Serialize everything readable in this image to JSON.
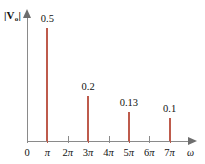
{
  "chart_data": {
    "type": "bar",
    "title": "",
    "subtitle": "",
    "xlabel": "ω",
    "ylabel": "|V₀|",
    "ylabel_main": "|V",
    "ylabel_sub": "o",
    "ylabel_close": "|",
    "categories": [
      "0",
      "π",
      "2π",
      "3π",
      "4π",
      "5π",
      "6π",
      "7π"
    ],
    "x": [
      0,
      1,
      2,
      3,
      4,
      5,
      6,
      7
    ],
    "values": [
      0,
      0.5,
      0,
      0.2,
      0,
      0.13,
      0,
      0.1
    ],
    "data_labels": [
      "",
      "0.5",
      "",
      "0.2",
      "",
      "0.13",
      "",
      "0.1"
    ],
    "xlim": [
      0,
      7.9
    ],
    "ylim": [
      0,
      0.58
    ],
    "grid": false,
    "legend": null,
    "annotations": [],
    "bar_color": "#be5b4c",
    "axis_color": "#8a8a8a",
    "text_color": "#111111"
  },
  "axes": {
    "y_title_main": "|V",
    "y_title_sub": "o",
    "y_title_end": "|",
    "x_title": "ω"
  },
  "ticks": [
    {
      "label_num": "0",
      "label_pi": "",
      "pos_pct": 0,
      "active": false
    },
    {
      "label_num": "",
      "label_pi": "π",
      "pos_pct": 12.5,
      "active": true
    },
    {
      "label_num": "2",
      "label_pi": "π",
      "pos_pct": 25,
      "active": false
    },
    {
      "label_num": "3",
      "label_pi": "π",
      "pos_pct": 37.5,
      "active": true
    },
    {
      "label_num": "4",
      "label_pi": "π",
      "pos_pct": 50,
      "active": false
    },
    {
      "label_num": "5",
      "label_pi": "π",
      "pos_pct": 62.5,
      "active": true
    },
    {
      "label_num": "6",
      "label_pi": "π",
      "pos_pct": 75,
      "active": false
    },
    {
      "label_num": "7",
      "label_pi": "π",
      "pos_pct": 87.5,
      "active": true
    }
  ],
  "stems": [
    {
      "label": "0.5",
      "value": 0.5,
      "at": "π"
    },
    {
      "label": "0.2",
      "value": 0.2,
      "at": "3π"
    },
    {
      "label": "0.13",
      "value": 0.13,
      "at": "5π"
    },
    {
      "label": "0.1",
      "value": 0.1,
      "at": "7π"
    }
  ]
}
